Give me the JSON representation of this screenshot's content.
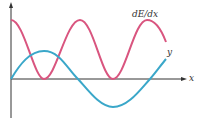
{
  "diagram": {
    "labels": {
      "curve_red": "dE/dx",
      "curve_blue": "y",
      "x_axis": "x"
    },
    "colors": {
      "red": "#d9557f",
      "blue": "#3aa7c9",
      "axis": "#333333"
    }
  }
}
